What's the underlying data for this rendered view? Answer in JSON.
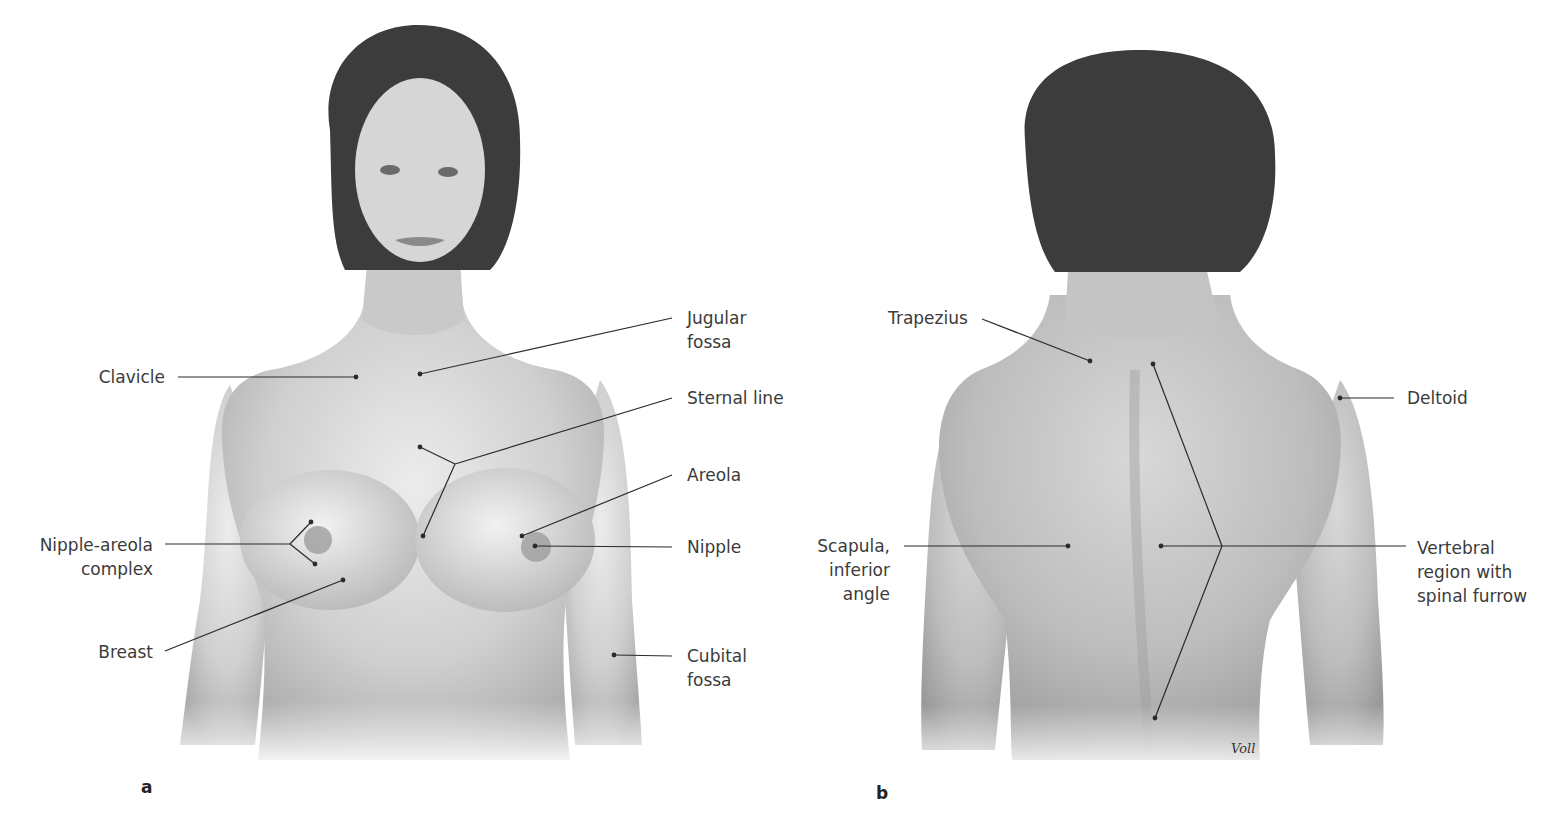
{
  "figure": {
    "panels": [
      {
        "id": "a",
        "letter": "a",
        "view": "anterior",
        "labels": {
          "jugular_fossa": [
            "Jugular",
            "fossa"
          ],
          "clavicle": "Clavicle",
          "sternal_line": "Sternal line",
          "areola": "Areola",
          "nipple_areola_complex": [
            "Nipple-areola",
            "complex"
          ],
          "nipple": "Nipple",
          "breast": "Breast",
          "cubital_fossa": [
            "Cubital",
            "fossa"
          ]
        }
      },
      {
        "id": "b",
        "letter": "b",
        "view": "posterior",
        "labels": {
          "trapezius": "Trapezius",
          "deltoid": "Deltoid",
          "scapula_inferior_angle": [
            "Scapula,",
            "inferior",
            "angle"
          ],
          "vertebral_region": [
            "Vertebral",
            "region with",
            "spinal furrow"
          ]
        },
        "signature": "Voll"
      }
    ]
  },
  "colors": {
    "background": "#ffffff",
    "skin_light": "#e6e6e6",
    "skin_mid": "#bdbdbd",
    "skin_dark": "#8f8f8f",
    "hair": "#3c3c3c",
    "leader_line": "#2a2a2a",
    "label_text": "#3b3b3b"
  }
}
